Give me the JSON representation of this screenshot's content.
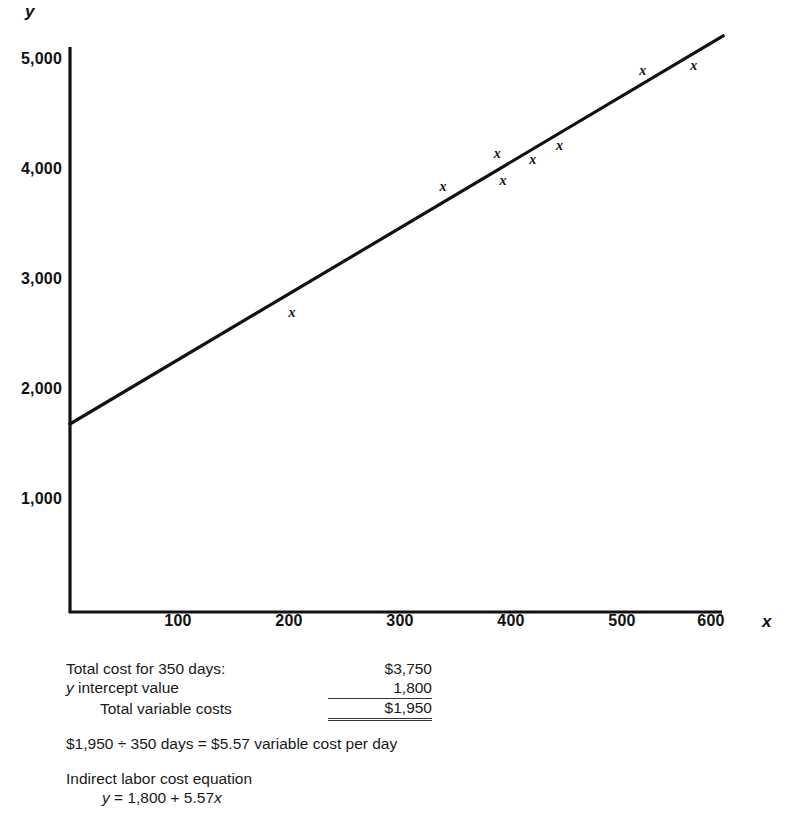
{
  "chart_data": {
    "type": "scatter",
    "title": "",
    "xlabel": "x",
    "ylabel": "y",
    "xlim": [
      0,
      650
    ],
    "ylim": [
      0,
      5200
    ],
    "grid": false,
    "legend": "none",
    "x_ticks": [
      "100",
      "200",
      "300",
      "400",
      "500",
      "600"
    ],
    "x_tick_values": [
      100,
      200,
      300,
      400,
      500,
      600
    ],
    "y_ticks": [
      "1,000",
      "2,000",
      "3,000",
      "4,000",
      "5,000"
    ],
    "y_tick_values": [
      1000,
      2000,
      3000,
      4000,
      5000
    ],
    "marker_symbol": "x",
    "points": [
      {
        "x": 200,
        "y": 2700
      },
      {
        "x": 336,
        "y": 3850
      },
      {
        "x": 385,
        "y": 4150
      },
      {
        "x": 390,
        "y": 3900
      },
      {
        "x": 417,
        "y": 4090
      },
      {
        "x": 441,
        "y": 4215
      },
      {
        "x": 516,
        "y": 4900
      },
      {
        "x": 562,
        "y": 4950
      }
    ],
    "trend_line": {
      "intercept": 1800,
      "slope": 5.57,
      "x_start": 0,
      "x_end": 588,
      "y_start": 1700,
      "y_end": 5175
    }
  },
  "calculations": {
    "rows": [
      {
        "label": "Total cost for 350 days:",
        "amount": "$3,750",
        "style": "plain"
      },
      {
        "label": "y intercept value",
        "amount": "1,800",
        "style": "italic-lead"
      },
      {
        "label": "Total variable costs",
        "amount": "$1,950",
        "style": "indent-total"
      }
    ],
    "variable_cost_line": "$1,950  ÷  350 days  =  $5.57 variable cost per day",
    "equation_heading": "Indirect labor cost equation",
    "equation": "y  =  1,800  +  5.57x"
  }
}
